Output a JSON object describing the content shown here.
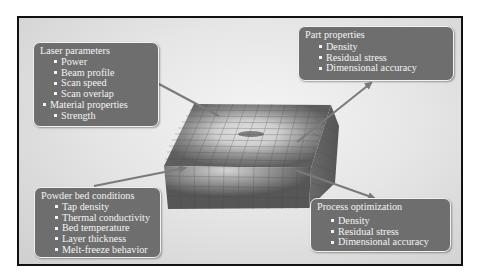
{
  "diagram": {
    "type": "process-influence-diagram",
    "center": {
      "label": "powder-bed-block",
      "description": "3D meshed powder bed block with heat-affected melt region"
    },
    "boxes": {
      "laser": {
        "title": "Laser parameters",
        "items": [
          {
            "text": "Power",
            "level": 1
          },
          {
            "text": "Beam profile",
            "level": 1
          },
          {
            "text": "Scan speed",
            "level": 1
          },
          {
            "text": "Scan overlap",
            "level": 1
          },
          {
            "text": "Material properties",
            "level": 0
          },
          {
            "text": "Strength",
            "level": 1
          }
        ]
      },
      "part": {
        "title": "Part properties",
        "items": [
          {
            "text": "Density",
            "level": 1
          },
          {
            "text": "Residual stress",
            "level": 1
          },
          {
            "text": "Dimensional accuracy",
            "level": 1
          }
        ]
      },
      "powder": {
        "title": "Powder bed conditions",
        "items": [
          {
            "text": "Tap density",
            "level": 1
          },
          {
            "text": "Thermal conductivity",
            "level": 1
          },
          {
            "text": "Bed temperature",
            "level": 1
          },
          {
            "text": "Layer thickness",
            "level": 1
          },
          {
            "text": "Melt-freeze behavior",
            "level": 1
          }
        ]
      },
      "process": {
        "title": "Process optimization",
        "items": [
          {
            "text": "Density",
            "level": 1
          },
          {
            "text": "Residual stress",
            "level": 1
          },
          {
            "text": "Dimensional accuracy",
            "level": 1
          }
        ]
      }
    },
    "arrows": [
      {
        "from": "laser",
        "to": "center"
      },
      {
        "from": "powder",
        "to": "center"
      },
      {
        "from": "center",
        "to": "part"
      },
      {
        "from": "center",
        "to": "process"
      }
    ],
    "colors": {
      "box_fill": "#6e6e6e",
      "box_border": "#f2f2f2",
      "box_text": "#f4f4f4",
      "arrow": "#7a7a7a",
      "frame_border": "#111111",
      "block_dark": "#5a5a5a",
      "block_light": "#d9d9d9"
    }
  }
}
